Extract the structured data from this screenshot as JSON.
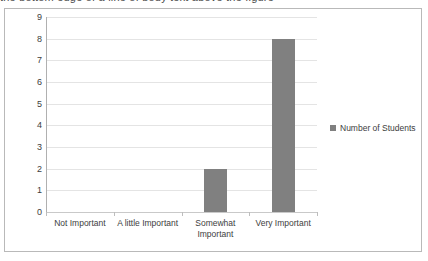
{
  "clipped_text_above": "the bottom edge of a line of body text above the figure",
  "legend": {
    "marker": "square-marker",
    "label": "Number of Students",
    "position": "right"
  },
  "colors": {
    "bar": "#808080",
    "gridline": "#e4e4e4",
    "axis": "#b0b0b0",
    "frame": "#b9b9b9",
    "text": "#3d3d3d",
    "background": "#ffffff"
  },
  "chart_data": {
    "type": "bar",
    "title": "",
    "subtitle": "",
    "xlabel": "",
    "ylabel": "",
    "categories": [
      "Not Important",
      "A little Important",
      "Somewhat Important",
      "Very Important"
    ],
    "category_lines": [
      [
        "Not Important"
      ],
      [
        "A little Important"
      ],
      [
        "Somewhat",
        "Important"
      ],
      [
        "Very Important"
      ]
    ],
    "series": [
      {
        "name": "Number of Students",
        "values": [
          0,
          0,
          2,
          8
        ],
        "color": "#808080"
      }
    ],
    "values": [
      0,
      0,
      2,
      8
    ],
    "ylim": [
      0,
      9
    ],
    "ytick_values": [
      0,
      1,
      2,
      3,
      4,
      5,
      6,
      7,
      8,
      9
    ],
    "ytick_labels": [
      "0",
      "1",
      "2",
      "3",
      "4",
      "5",
      "6",
      "7",
      "8",
      "9"
    ],
    "y_tick_step": 1,
    "grid": true,
    "grid_axis": "y",
    "legend": true,
    "legend_position": "right",
    "orientation": "vertical"
  }
}
